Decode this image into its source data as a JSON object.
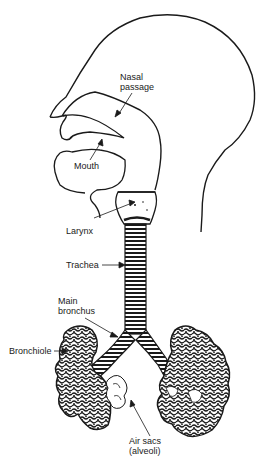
{
  "diagram": {
    "colors": {
      "line": "#1a1a1a",
      "background": "#ffffff"
    },
    "labels": {
      "nasal_passage": {
        "line1": "Nasal",
        "line2": "passage"
      },
      "mouth": "Mouth",
      "larynx": "Larynx",
      "trachea": "Trachea",
      "main_bronchus": {
        "line1": "Main",
        "line2": "bronchus"
      },
      "bronchiole": "Bronchiole",
      "air_sacs": {
        "line1": "Air sacs",
        "line2": "(alveoli)"
      }
    }
  }
}
